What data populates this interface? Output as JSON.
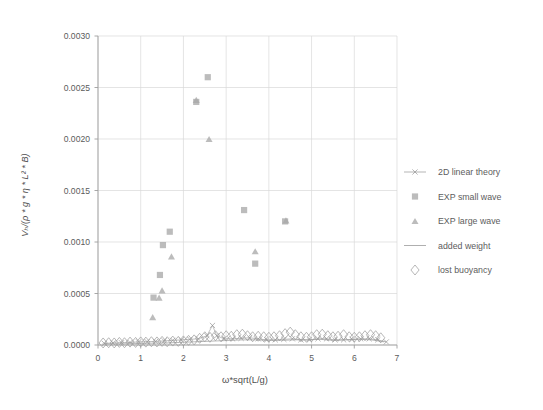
{
  "chart_data": {
    "type": "scatter",
    "title": "",
    "xlabel": "ω*sqrt(L/g)",
    "ylabel": "Vₕ/(ρ * g * η * L² * B)",
    "xlim": [
      0,
      7
    ],
    "ylim": [
      0.0,
      0.003
    ],
    "xticks": [
      "0",
      "1",
      "2",
      "3",
      "4",
      "5",
      "6",
      "7"
    ],
    "xtick_values": [
      0,
      1,
      2,
      3,
      4,
      5,
      6,
      7
    ],
    "yticks": [
      "0.0000",
      "0.0005",
      "0.0010",
      "0.0015",
      "0.0020",
      "0.0025",
      "0.0030"
    ],
    "ytick_values": [
      0.0,
      0.0005,
      0.001,
      0.0015,
      0.002,
      0.0025,
      0.003
    ],
    "grid": true,
    "legend_position": "right",
    "marker_color": "#a9a9a9",
    "line_color": "#8c8c8c",
    "open_marker_color": "#9a9a9a",
    "grid_color": "#d9d9d9",
    "axis_color": "#9e9e9e",
    "series": [
      {
        "name": "2D linear theory",
        "marker": "line-x",
        "points": [
          {
            "x": 0.15,
            "y": 1.5e-05
          },
          {
            "x": 0.35,
            "y": 2e-05
          },
          {
            "x": 0.55,
            "y": 2.2e-05
          },
          {
            "x": 0.75,
            "y": 2.5e-05
          },
          {
            "x": 0.95,
            "y": 3e-05
          },
          {
            "x": 1.15,
            "y": 3.2e-05
          },
          {
            "x": 1.35,
            "y": 3.5e-05
          },
          {
            "x": 1.55,
            "y": 4e-05
          },
          {
            "x": 1.75,
            "y": 4.5e-05
          },
          {
            "x": 1.95,
            "y": 5e-05
          },
          {
            "x": 2.15,
            "y": 5.5e-05
          },
          {
            "x": 2.35,
            "y": 6e-05
          },
          {
            "x": 2.55,
            "y": 9e-05
          },
          {
            "x": 2.68,
            "y": 0.00019
          },
          {
            "x": 2.78,
            "y": 9e-05
          },
          {
            "x": 2.95,
            "y": 6e-05
          },
          {
            "x": 3.15,
            "y": 6e-05
          },
          {
            "x": 3.35,
            "y": 6.5e-05
          },
          {
            "x": 3.55,
            "y": 7e-05
          },
          {
            "x": 3.75,
            "y": 6e-05
          },
          {
            "x": 3.95,
            "y": 5e-05
          },
          {
            "x": 4.15,
            "y": 5e-05
          },
          {
            "x": 4.35,
            "y": 5.5e-05
          },
          {
            "x": 4.55,
            "y": 6e-05
          },
          {
            "x": 4.75,
            "y": 5e-05
          },
          {
            "x": 4.95,
            "y": 5e-05
          },
          {
            "x": 5.15,
            "y": 6e-05
          },
          {
            "x": 5.35,
            "y": 6e-05
          },
          {
            "x": 5.55,
            "y": 5e-05
          },
          {
            "x": 5.75,
            "y": 5e-05
          },
          {
            "x": 5.95,
            "y": 5.5e-05
          },
          {
            "x": 6.15,
            "y": 6e-05
          },
          {
            "x": 6.35,
            "y": 6e-05
          },
          {
            "x": 6.55,
            "y": 5e-05
          },
          {
            "x": 6.75,
            "y": 3e-05
          }
        ]
      },
      {
        "name": "EXP small wave",
        "marker": "square",
        "points": [
          {
            "x": 1.3,
            "y": 0.00046
          },
          {
            "x": 1.45,
            "y": 0.00068
          },
          {
            "x": 1.52,
            "y": 0.00097
          },
          {
            "x": 1.68,
            "y": 0.0011
          },
          {
            "x": 2.3,
            "y": 0.00236
          },
          {
            "x": 2.57,
            "y": 0.0026
          },
          {
            "x": 3.42,
            "y": 0.00131
          },
          {
            "x": 3.68,
            "y": 0.00079
          },
          {
            "x": 4.38,
            "y": 0.0012
          }
        ]
      },
      {
        "name": "EXP large wave",
        "marker": "triangle",
        "points": [
          {
            "x": 1.28,
            "y": 0.00027
          },
          {
            "x": 1.43,
            "y": 0.00046
          },
          {
            "x": 1.5,
            "y": 0.00053
          },
          {
            "x": 1.72,
            "y": 0.00086
          },
          {
            "x": 2.3,
            "y": 0.00238
          },
          {
            "x": 2.6,
            "y": 0.002
          },
          {
            "x": 3.68,
            "y": 0.00091
          },
          {
            "x": 4.4,
            "y": 0.00121
          }
        ]
      },
      {
        "name": "added weight",
        "marker": "line",
        "points": [
          {
            "x": 0.1,
            "y": 1e-05
          },
          {
            "x": 0.4,
            "y": 1e-05
          },
          {
            "x": 0.7,
            "y": 1.2e-05
          },
          {
            "x": 1.0,
            "y": 1.5e-05
          },
          {
            "x": 1.3,
            "y": 1.8e-05
          },
          {
            "x": 1.6,
            "y": 2e-05
          },
          {
            "x": 1.9,
            "y": 2.5e-05
          },
          {
            "x": 2.2,
            "y": 3e-05
          },
          {
            "x": 2.5,
            "y": 3.5e-05
          },
          {
            "x": 2.8,
            "y": 4e-05
          },
          {
            "x": 3.1,
            "y": 4.5e-05
          },
          {
            "x": 3.4,
            "y": 5e-05
          },
          {
            "x": 3.7,
            "y": 5e-05
          },
          {
            "x": 4.0,
            "y": 4.5e-05
          },
          {
            "x": 4.3,
            "y": 4.5e-05
          },
          {
            "x": 4.6,
            "y": 5e-05
          },
          {
            "x": 4.9,
            "y": 5e-05
          },
          {
            "x": 5.2,
            "y": 5.5e-05
          },
          {
            "x": 5.5,
            "y": 4.5e-05
          },
          {
            "x": 5.8,
            "y": 5e-05
          },
          {
            "x": 6.1,
            "y": 5.5e-05
          },
          {
            "x": 6.4,
            "y": 5e-05
          },
          {
            "x": 6.7,
            "y": 3e-05
          }
        ]
      },
      {
        "name": "lost buoyancy",
        "marker": "diamond-open",
        "points": [
          {
            "x": 0.12,
            "y": 2e-05
          },
          {
            "x": 0.25,
            "y": 2.2e-05
          },
          {
            "x": 0.38,
            "y": 2e-05
          },
          {
            "x": 0.5,
            "y": 2.5e-05
          },
          {
            "x": 0.62,
            "y": 2.2e-05
          },
          {
            "x": 0.75,
            "y": 2.8e-05
          },
          {
            "x": 0.88,
            "y": 2.5e-05
          },
          {
            "x": 1.0,
            "y": 3e-05
          },
          {
            "x": 1.12,
            "y": 2.8e-05
          },
          {
            "x": 1.25,
            "y": 3.2e-05
          },
          {
            "x": 1.38,
            "y": 3e-05
          },
          {
            "x": 1.5,
            "y": 3.5e-05
          },
          {
            "x": 1.62,
            "y": 3.2e-05
          },
          {
            "x": 1.75,
            "y": 3.8e-05
          },
          {
            "x": 1.88,
            "y": 3.5e-05
          },
          {
            "x": 2.0,
            "y": 4e-05
          },
          {
            "x": 2.12,
            "y": 4.5e-05
          },
          {
            "x": 2.25,
            "y": 5e-05
          },
          {
            "x": 2.38,
            "y": 6.5e-05
          },
          {
            "x": 2.5,
            "y": 8e-05
          },
          {
            "x": 2.62,
            "y": 7.5e-05
          },
          {
            "x": 2.75,
            "y": 9e-05
          },
          {
            "x": 2.88,
            "y": 8e-05
          },
          {
            "x": 3.0,
            "y": 9e-05
          },
          {
            "x": 3.12,
            "y": 8.5e-05
          },
          {
            "x": 3.25,
            "y": 0.0001
          },
          {
            "x": 3.38,
            "y": 0.000105
          },
          {
            "x": 3.5,
            "y": 9e-05
          },
          {
            "x": 3.62,
            "y": 8e-05
          },
          {
            "x": 3.75,
            "y": 8.5e-05
          },
          {
            "x": 3.88,
            "y": 8e-05
          },
          {
            "x": 4.0,
            "y": 7.5e-05
          },
          {
            "x": 4.12,
            "y": 8e-05
          },
          {
            "x": 4.25,
            "y": 9e-05
          },
          {
            "x": 4.38,
            "y": 0.00011
          },
          {
            "x": 4.5,
            "y": 0.000125
          },
          {
            "x": 4.62,
            "y": 0.0001
          },
          {
            "x": 4.75,
            "y": 8e-05
          },
          {
            "x": 4.88,
            "y": 7.5e-05
          },
          {
            "x": 5.0,
            "y": 8e-05
          },
          {
            "x": 5.12,
            "y": 0.0001
          },
          {
            "x": 5.25,
            "y": 0.000105
          },
          {
            "x": 5.38,
            "y": 9e-05
          },
          {
            "x": 5.5,
            "y": 8e-05
          },
          {
            "x": 5.62,
            "y": 8.5e-05
          },
          {
            "x": 5.75,
            "y": 0.0001
          },
          {
            "x": 5.88,
            "y": 8e-05
          },
          {
            "x": 6.0,
            "y": 7.5e-05
          },
          {
            "x": 6.12,
            "y": 8e-05
          },
          {
            "x": 6.25,
            "y": 9e-05
          },
          {
            "x": 6.38,
            "y": 0.0001
          },
          {
            "x": 6.5,
            "y": 9e-05
          },
          {
            "x": 6.62,
            "y": 7e-05
          }
        ]
      }
    ]
  },
  "legend": {
    "items": [
      {
        "label": "2D linear theory",
        "marker": "line-x"
      },
      {
        "label": "EXP small wave",
        "marker": "square"
      },
      {
        "label": "EXP large wave",
        "marker": "triangle"
      },
      {
        "label": "added weight",
        "marker": "line"
      },
      {
        "label": "lost buoyancy",
        "marker": "diamond-open"
      }
    ]
  }
}
